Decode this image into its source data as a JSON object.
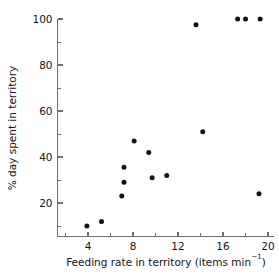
{
  "chart_data": {
    "type": "scatter",
    "title": "",
    "xlabel": "Feeding rate in territory (items min⁻¹)",
    "xlabel_main": "Feeding rate in territory (items min",
    "xlabel_sup": "−1",
    "xlabel_tail": ")",
    "ylabel": "% day spent in territory",
    "xlim": [
      2,
      20.8
    ],
    "ylim": [
      4,
      104
    ],
    "xticks": [
      4,
      8,
      12,
      16,
      20
    ],
    "xtick_labels": [
      "4",
      "8",
      "12",
      "16",
      "20"
    ],
    "xminorticks": [
      2,
      6,
      10,
      14,
      18
    ],
    "yticks": [
      20,
      40,
      60,
      80,
      100
    ],
    "ytick_labels": [
      "20",
      "40",
      "60",
      "80",
      "100"
    ],
    "yminorticks": [
      10,
      30,
      50,
      70,
      90
    ],
    "grid": false,
    "legend": null,
    "marker": "filled-circle",
    "marker_color": "#121212",
    "marker_size_px": 5,
    "points": [
      {
        "x": 3.9,
        "y": 10
      },
      {
        "x": 5.2,
        "y": 12
      },
      {
        "x": 7.0,
        "y": 23
      },
      {
        "x": 7.2,
        "y": 29
      },
      {
        "x": 7.2,
        "y": 35.5
      },
      {
        "x": 8.1,
        "y": 47
      },
      {
        "x": 9.4,
        "y": 42
      },
      {
        "x": 9.7,
        "y": 31
      },
      {
        "x": 11.0,
        "y": 32
      },
      {
        "x": 13.6,
        "y": 97.5
      },
      {
        "x": 14.2,
        "y": 51
      },
      {
        "x": 17.3,
        "y": 100
      },
      {
        "x": 18.0,
        "y": 100
      },
      {
        "x": 19.3,
        "y": 100
      },
      {
        "x": 19.2,
        "y": 24
      }
    ]
  },
  "figure": {
    "width": 279,
    "height": 274,
    "background": "#ffffff",
    "axis_color": "#6f6f6f",
    "text_color": "#141414"
  }
}
